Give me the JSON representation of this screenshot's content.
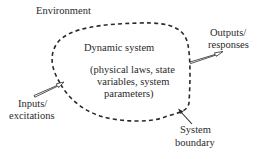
{
  "diagram": {
    "type": "system-boundary-concept",
    "environment_label": "Environment",
    "system": {
      "title": "Dynamic system",
      "details_lines": [
        "(physical laws, state",
        "variables, system",
        "parameters)"
      ]
    },
    "outputs": {
      "lines": [
        "Outputs/",
        "responses"
      ]
    },
    "inputs": {
      "lines": [
        "Inputs/",
        "excitations"
      ]
    },
    "boundary": {
      "lines": [
        "System",
        "boundary"
      ],
      "style": "dashed"
    },
    "colors": {
      "ink": "#2a2a2a",
      "background": "#ffffff"
    }
  }
}
